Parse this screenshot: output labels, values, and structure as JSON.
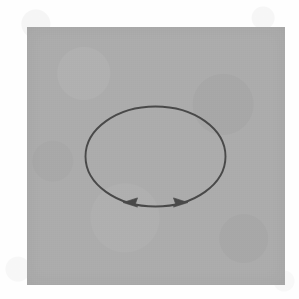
{
  "figure": {
    "page_background_color": "#fefefe",
    "panel": {
      "name": "scanned-gray-plate",
      "fill_color": "#adadad",
      "x": 27,
      "y": 27,
      "width": 258,
      "height": 258
    },
    "ellipse": {
      "name": "closed-loop",
      "center_x": 155.5,
      "center_y": 156.5,
      "radius_x": 70,
      "radius_y": 50,
      "stroke_color": "#4a4a4a",
      "stroke_width": 1.9,
      "label": ""
    },
    "arrows": [
      {
        "name": "arrowhead-left",
        "direction": "left",
        "tip_x": 123,
        "tip_y": 202.5,
        "on_arc": "bottom",
        "color": "#4a4a4a",
        "label": ""
      },
      {
        "name": "arrowhead-right",
        "direction": "right",
        "tip_x": 188,
        "tip_y": 202.5,
        "on_arc": "bottom",
        "color": "#4a4a4a",
        "label": ""
      }
    ],
    "annotations": [],
    "caption": ""
  }
}
